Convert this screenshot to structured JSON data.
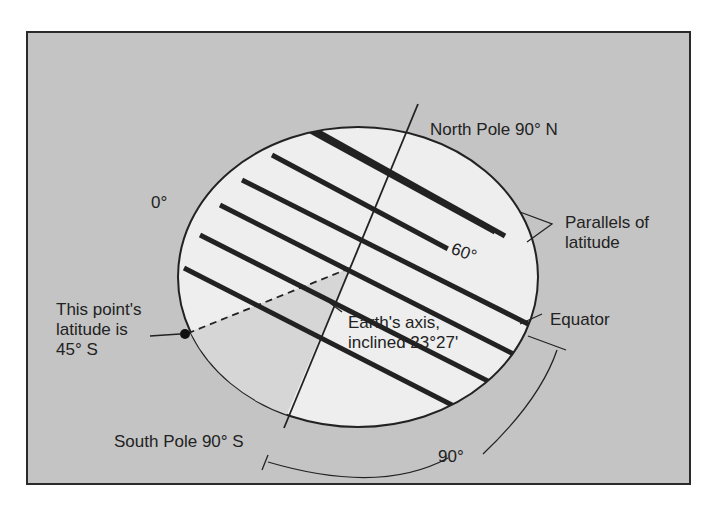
{
  "diagram": {
    "type": "globe-latitude",
    "labels": {
      "north_pole": "North Pole 90° N",
      "south_pole": "South Pole 90° S",
      "zero_deg": "0°",
      "sixty_deg": "60°",
      "parallels_line1": "Parallels of",
      "parallels_line2": "latitude",
      "equator": "Equator",
      "point_line1": "This point's",
      "point_line2": "latitude is",
      "point_line3": "45° S",
      "axis_line1": "Earth's axis,",
      "axis_line2": "inclined 23°27'",
      "ninety_deg": "90°"
    },
    "colors": {
      "background": "#c4c4c4",
      "globe_fill": "#eeeeee",
      "sector_fill": "#d8d8d8",
      "line": "#222222"
    }
  }
}
